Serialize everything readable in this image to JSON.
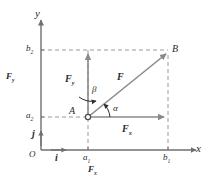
{
  "figure": {
    "colors": {
      "axis": "#6f6f6f",
      "vector": "#8a8a8a",
      "dashed": "#9a9a9a",
      "text": "#2b2b2b",
      "background": "#ffffff"
    }
  },
  "axes": {
    "x_label": "x",
    "y_label": "y",
    "origin_label": "O"
  },
  "ticks": {
    "x": [
      {
        "id": "a1",
        "base": "a",
        "sub": "1",
        "value_px": 88
      },
      {
        "id": "b1",
        "base": "b",
        "sub": "1",
        "value_px": 168
      }
    ],
    "y": [
      {
        "id": "a2",
        "base": "a",
        "sub": "2",
        "value_px": 117
      },
      {
        "id": "b2",
        "base": "b",
        "sub": "2",
        "value_px": 50
      }
    ]
  },
  "points": [
    {
      "name": "A",
      "label": "A",
      "x": 88,
      "y": 117
    },
    {
      "name": "B",
      "label": "B",
      "x": 168,
      "y": 52
    }
  ],
  "vectors": [
    {
      "name": "resultant-force",
      "label": "F",
      "sub": "",
      "from": "A",
      "to": "B"
    },
    {
      "name": "force-x-component",
      "label": "F",
      "sub": "x",
      "direction": "horizontal"
    },
    {
      "name": "force-y-component",
      "label": "F",
      "sub": "y",
      "direction": "vertical"
    },
    {
      "name": "unit-vector-i",
      "label": "i",
      "direction": "horizontal"
    },
    {
      "name": "unit-vector-j",
      "label": "j",
      "direction": "vertical"
    }
  ],
  "angles": [
    {
      "name": "alpha",
      "label": "α",
      "measured_from": "x-axis"
    },
    {
      "name": "beta",
      "label": "β",
      "measured_from": "y-axis"
    }
  ],
  "dimension_labels": [
    {
      "name": "fx-span",
      "base": "F",
      "sub": "x",
      "position": "bottom"
    },
    {
      "name": "fy-span",
      "base": "F",
      "sub": "y",
      "position": "left"
    }
  ]
}
